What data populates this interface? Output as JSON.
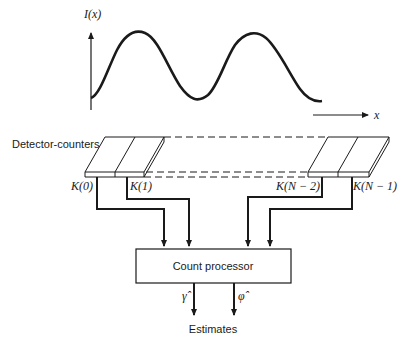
{
  "diagram": {
    "plot": {
      "y_label": "I(x)",
      "x_label": "x",
      "curve": "sinusoidal intensity, two full periods"
    },
    "detector_label": "Detector-counters",
    "counters": [
      {
        "label": "K(0)"
      },
      {
        "label": "K(1)"
      },
      {
        "label": "K(N − 2)"
      },
      {
        "label": "K(N − 1)"
      }
    ],
    "processor_label": "Count processor",
    "outputs": [
      {
        "symbol": "γ̂"
      },
      {
        "symbol": "φ̂"
      }
    ],
    "estimates_label": "Estimates",
    "colors": {
      "ink": "#1a1a1a",
      "background": "#ffffff"
    }
  }
}
